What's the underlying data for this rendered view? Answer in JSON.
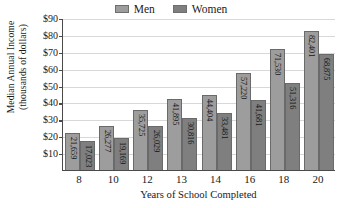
{
  "chart_data": {
    "type": "bar",
    "title": "",
    "xlabel": "Years of School Completed",
    "ylabel_line1": "Median Annual Income",
    "ylabel_line2": "(thousands of dollars)",
    "categories": [
      "8",
      "10",
      "12",
      "13",
      "14",
      "16",
      "18",
      "20"
    ],
    "series": [
      {
        "name": "Men",
        "color": "#9d9d9d",
        "values": [
          21659,
          26277,
          35725,
          41895,
          44404,
          57220,
          71530,
          82401
        ],
        "labels": [
          "21,659",
          "26,277",
          "35,725",
          "41,895",
          "44,404",
          "57,220",
          "71,530",
          "82,401"
        ]
      },
      {
        "name": "Women",
        "color": "#7f7f7f",
        "values": [
          17023,
          19169,
          26029,
          30816,
          33481,
          41681,
          51316,
          68875
        ],
        "labels": [
          "17,023",
          "19,169",
          "26,029",
          "30,816",
          "33,481",
          "41,681",
          "51,316",
          "68,875"
        ]
      }
    ],
    "ylim": [
      0,
      90000
    ],
    "ytick_values": [
      10000,
      20000,
      30000,
      40000,
      50000,
      60000,
      70000,
      80000,
      90000
    ],
    "ytick_labels": [
      "$10",
      "$20",
      "$30",
      "$40",
      "$50",
      "$60",
      "$70",
      "$80",
      "$90"
    ],
    "grid": true,
    "legend_position": "top-center"
  },
  "legend": {
    "entries": [
      {
        "label": "Men",
        "color": "#9d9d9d"
      },
      {
        "label": "Women",
        "color": "#7f7f7f"
      }
    ]
  }
}
